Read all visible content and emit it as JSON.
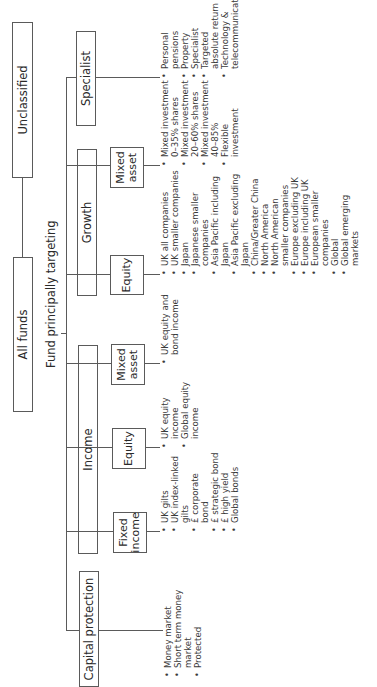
{
  "diagram": {
    "root": {
      "label": "All funds"
    },
    "unclassified": {
      "label": "Unclassified"
    },
    "caption": "Fund principally targeting",
    "categories": [
      {
        "label": "Capital protection",
        "items": [
          "Money market",
          "Short term money market",
          "Protected"
        ]
      },
      {
        "label": "Income",
        "subcategories": [
          {
            "label_line1": "Fixed",
            "label_line2": "income",
            "items": [
              "UK gilts",
              "UK index-linked gilts",
              "£ corporate bond",
              "£ strategic bond",
              "£ high yield",
              "Global bonds"
            ]
          },
          {
            "label_line1": "Equity",
            "label_line2": "",
            "items": [
              "UK equity income",
              "Global equity income"
            ]
          },
          {
            "label_line1": "Mixed",
            "label_line2": "asset",
            "items": [
              "UK equity and bond income"
            ]
          }
        ]
      },
      {
        "label": "Growth",
        "subcategories": [
          {
            "label_line1": "Equity",
            "label_line2": "",
            "items": [
              "UK all companies",
              "UK smaller companies",
              "Japan",
              "Japanese smaller companies",
              "Asia Pacific including Japan",
              "Asia Pacific excluding Japan",
              "China/Greater China",
              "North America",
              "North American smaller companies",
              "Europe excluding UK",
              "Europe including UK",
              "European smaller companies",
              "Global",
              "Global emerging markets"
            ]
          },
          {
            "label_line1": "Mixed",
            "label_line2": "asset",
            "items": [
              "Mixed investment 0–35% shares",
              "Mixed investment 20–60% shares",
              "Mixed investment 40–85%",
              "Flexible investment"
            ]
          }
        ]
      },
      {
        "label": "Specialist",
        "items": [
          "Personal pensions",
          "Property",
          "Specialist",
          "Targeted absolute return",
          "Technology & telecommunications"
        ]
      }
    ]
  }
}
